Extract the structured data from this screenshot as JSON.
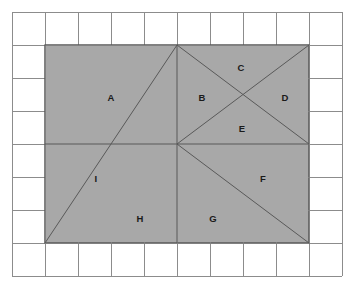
{
  "figure": {
    "type": "geometry-grid-diagram",
    "background_color": "#ffffff",
    "shaded_fill_color": "#a8a8a8",
    "grid_line_color": "#8c8c8c",
    "shape_line_color": "#595959",
    "label_color": "#1a1a1a",
    "grid": {
      "columns": 10,
      "rows": 8,
      "cell_size_px": 33,
      "origin_x_px": 12,
      "origin_y_px": 12,
      "total_width_px": 330,
      "total_height_px": 264
    },
    "shaded_rectangle": {
      "left_px": 45,
      "top_px": 45,
      "right_px": 309,
      "bottom_px": 243,
      "width_cells": 8,
      "height_cells": 6,
      "center_x_px": 177,
      "center_y_px": 144
    },
    "construction_lines": [
      {
        "name": "horizontal-midline",
        "from": [
          45,
          144
        ],
        "to": [
          309,
          144
        ]
      },
      {
        "name": "vertical-midline",
        "from": [
          177,
          45
        ],
        "to": [
          177,
          243
        ]
      },
      {
        "name": "diagonal-top-left-to-center",
        "from": [
          177,
          45
        ],
        "to": [
          45,
          243
        ]
      },
      {
        "name": "diagonal-upper-right-down",
        "from": [
          177,
          45
        ],
        "to": [
          309,
          144
        ]
      },
      {
        "name": "diagonal-center-to-upper-right",
        "from": [
          177,
          144
        ],
        "to": [
          309,
          45
        ]
      },
      {
        "name": "diagonal-center-to-bottom-right",
        "from": [
          177,
          144
        ],
        "to": [
          309,
          243
        ]
      }
    ],
    "labels": [
      {
        "id": "A",
        "text": "A",
        "x": 111,
        "y": 98
      },
      {
        "id": "B",
        "text": "B",
        "x": 202,
        "y": 98
      },
      {
        "id": "C",
        "text": "C",
        "x": 241,
        "y": 68
      },
      {
        "id": "D",
        "text": "D",
        "x": 285,
        "y": 98
      },
      {
        "id": "E",
        "text": "E",
        "x": 242,
        "y": 129
      },
      {
        "id": "F",
        "text": "F",
        "x": 263,
        "y": 179
      },
      {
        "id": "G",
        "text": "G",
        "x": 213,
        "y": 219
      },
      {
        "id": "H",
        "text": "H",
        "x": 140,
        "y": 219
      },
      {
        "id": "I",
        "text": "I",
        "x": 96,
        "y": 179
      }
    ]
  }
}
